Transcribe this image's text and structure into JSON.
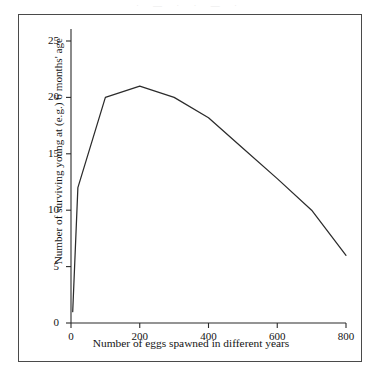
{
  "figure": {
    "background_color": "#ffffff",
    "frame_color": "#4a4a4a",
    "line_color": "#2b2b2b",
    "top_sliver_text": "· — · · — ·"
  },
  "chart_data": {
    "type": "line",
    "title": "",
    "xlabel": "Number of eggs spawned in different years",
    "ylabel": "Number of surviving young at (e.g.) 6 months' age",
    "xlim": [
      0,
      800
    ],
    "ylim": [
      0,
      25
    ],
    "xticks": [
      0,
      200,
      400,
      600,
      800
    ],
    "yticks": [
      0,
      5,
      10,
      15,
      20,
      25
    ],
    "xticklabels": [
      "0",
      "200",
      "400",
      "600",
      "800"
    ],
    "yticklabels": [
      "0",
      "5",
      "10",
      "15",
      "20",
      "25"
    ],
    "grid": false,
    "legend": false,
    "legend_position": "none",
    "series": [
      {
        "name": "surviving young",
        "x": [
          5,
          20,
          100,
          200,
          300,
          400,
          500,
          600,
          700,
          800
        ],
        "values": [
          1,
          12,
          20,
          21,
          20,
          18.2,
          15.5,
          12.8,
          10.0,
          6.0
        ]
      }
    ],
    "annotations": []
  },
  "axes": {
    "x_axis_name": "x-axis",
    "y_axis_name": "y-axis"
  }
}
